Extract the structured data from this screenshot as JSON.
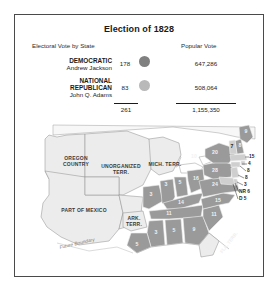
{
  "figure": {
    "title": "Election of 1828",
    "columns": {
      "electoral": "Electoral Vote by State",
      "popular": "Popular Vote"
    },
    "parties": [
      {
        "name": "DEMOCRATIC",
        "name_line2": "",
        "candidate": "Andrew Jackson",
        "electoral_votes": "178",
        "popular_votes": "647,286",
        "color": "#808080",
        "swatch": "democratic-color-dot"
      },
      {
        "name": "NATIONAL",
        "name_line2": "REPUBLICAN",
        "candidate": "John Q. Adams",
        "electoral_votes": "83",
        "popular_votes": "508,064",
        "color": "#b9b9b9",
        "swatch": "national-republican-color-dot"
      }
    ],
    "totals": {
      "electoral": "261",
      "popular": "1,155,350"
    }
  },
  "map": {
    "territories": [
      {
        "label": "OREGON",
        "label2": "COUNTRY"
      },
      {
        "label": "UNORGANIZED",
        "label2": "TERR."
      },
      {
        "label": "PART OF MEXICO",
        "label2": ""
      },
      {
        "label": "MICH. TERR.",
        "label2": ""
      },
      {
        "label": "ARK.",
        "label2": "TERR."
      },
      {
        "label": "FLA. TERR.",
        "label2": ""
      }
    ],
    "future_boundary_label": "Future Boundary",
    "state_votes": [
      {
        "name": "maine",
        "value": "9"
      },
      {
        "name": "new-hampshire",
        "value": "8"
      },
      {
        "name": "vermont",
        "value": "7"
      },
      {
        "name": "massachusetts",
        "value": "15"
      },
      {
        "name": "rhode-island",
        "value": "4"
      },
      {
        "name": "connecticut",
        "value": "8"
      },
      {
        "name": "new-york",
        "value": "20"
      },
      {
        "name": "new-jersey",
        "value": "8"
      },
      {
        "name": "pennsylvania",
        "value": "28"
      },
      {
        "name": "delaware",
        "value": "3"
      },
      {
        "name": "maryland-nr",
        "value": "NR 6"
      },
      {
        "name": "maryland-d",
        "value": "D 5"
      },
      {
        "name": "virginia",
        "value": "24"
      },
      {
        "name": "north-carolina",
        "value": "15"
      },
      {
        "name": "south-carolina",
        "value": "11"
      },
      {
        "name": "georgia",
        "value": "9"
      },
      {
        "name": "ohio",
        "value": "16"
      },
      {
        "name": "indiana",
        "value": "5"
      },
      {
        "name": "illinois",
        "value": "3"
      },
      {
        "name": "kentucky",
        "value": "14"
      },
      {
        "name": "tennessee",
        "value": "11"
      },
      {
        "name": "alabama",
        "value": "5"
      },
      {
        "name": "mississippi",
        "value": "3"
      },
      {
        "name": "louisiana",
        "value": "5"
      },
      {
        "name": "missouri",
        "value": "3"
      },
      {
        "name": "ny-extra",
        "value": "10"
      }
    ]
  }
}
